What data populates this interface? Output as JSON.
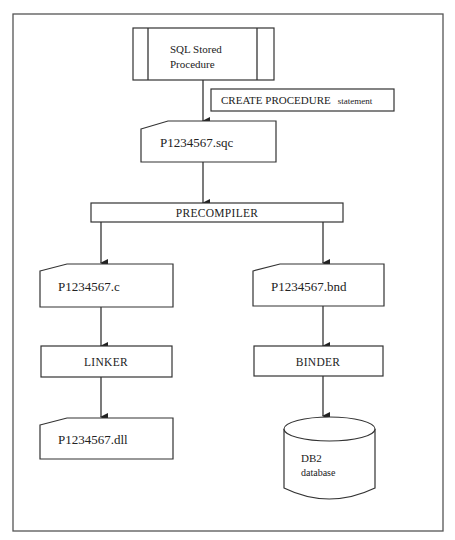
{
  "diagram": {
    "nodes": {
      "sql_stored_procedure": {
        "line1": "SQL Stored",
        "line2": "Procedure"
      },
      "create_procedure_note": {
        "main": "CREATE PROCEDURE",
        "suffix": "statement"
      },
      "sqc_file": {
        "label": "P1234567.sqc"
      },
      "precompiler": {
        "label": "PRECOMPILER"
      },
      "c_file": {
        "label": "P1234567.c"
      },
      "bnd_file": {
        "label": "P1234567.bnd"
      },
      "linker": {
        "label": "LINKER"
      },
      "binder": {
        "label": "BINDER"
      },
      "dll_file": {
        "label": "P1234567.dll"
      },
      "db2_database": {
        "line1": "DB2",
        "line2": "database"
      }
    },
    "edges": [
      {
        "from": "sql_stored_procedure",
        "to": "sqc_file",
        "label": "CREATE PROCEDURE statement"
      },
      {
        "from": "sqc_file",
        "to": "precompiler"
      },
      {
        "from": "precompiler",
        "to": "c_file"
      },
      {
        "from": "precompiler",
        "to": "bnd_file"
      },
      {
        "from": "c_file",
        "to": "linker"
      },
      {
        "from": "linker",
        "to": "dll_file"
      },
      {
        "from": "bnd_file",
        "to": "binder"
      },
      {
        "from": "binder",
        "to": "db2_database"
      }
    ]
  }
}
